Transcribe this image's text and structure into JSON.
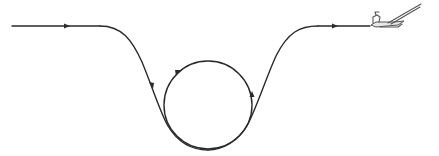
{
  "diagram": {
    "colors": {
      "path": "#2a2a2a",
      "aircraft": "#555555",
      "background": "#ffffff"
    },
    "elements": {
      "entry_segment": "level entry flight",
      "dive": "descending dive",
      "loop": "vertical loop",
      "climb": "climb out",
      "exit_segment": "level exit flight",
      "aircraft": "glider"
    },
    "arrows": [
      {
        "name": "entry-direction",
        "direction": "right"
      },
      {
        "name": "dive-direction",
        "direction": "down"
      },
      {
        "name": "loop-top-direction",
        "direction": "down-left"
      },
      {
        "name": "loop-right-direction",
        "direction": "up"
      },
      {
        "name": "exit-direction",
        "direction": "right"
      }
    ]
  }
}
